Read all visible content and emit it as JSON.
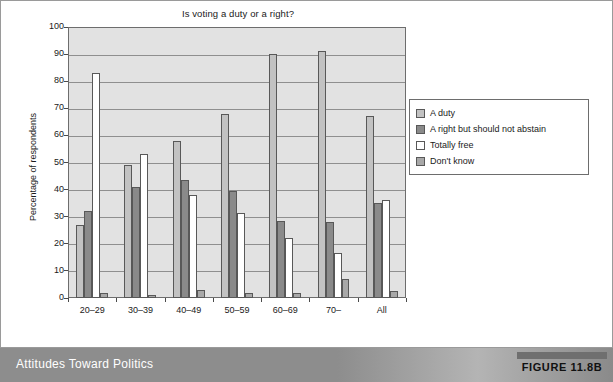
{
  "figure": {
    "caption": "Attitudes Toward Politics",
    "number_label": "FIGURE 11.8B"
  },
  "chart_data": {
    "type": "bar",
    "title": "Is voting a duty or a right?",
    "xlabel": "Age group",
    "ylabel": "Percentage of respondents",
    "ylim": [
      0,
      100
    ],
    "ytick_step": 10,
    "yticks": [
      0,
      10,
      20,
      30,
      40,
      50,
      60,
      70,
      80,
      90,
      100
    ],
    "grid": true,
    "grid_axis": "y",
    "legend_position": "right",
    "categories": [
      "20–29",
      "30–39",
      "40–49",
      "50–59",
      "60–69",
      "70–",
      "All"
    ],
    "series": [
      {
        "name": "A duty",
        "color": "#c2c2c2",
        "values": [
          27,
          49,
          58,
          68,
          90,
          91,
          67
        ]
      },
      {
        "name": "A right but should not abstain",
        "color": "#8a8a8a",
        "values": [
          32,
          41,
          43.5,
          39.5,
          28.5,
          28,
          35
        ]
      },
      {
        "name": "Totally free",
        "color": "#ffffff",
        "values": [
          83,
          53,
          38,
          31.5,
          22,
          16.5,
          36
        ]
      },
      {
        "name": "Don't know",
        "color": "#a8a8a8",
        "values": [
          2,
          1,
          3,
          2,
          2,
          7,
          2.5
        ]
      }
    ]
  },
  "colors": {
    "plot_background": "#e2e2e2",
    "gridline": "#8f8f8f",
    "axis": "#6d6d6d",
    "bar_outline": "#585858",
    "footer_band": "#8d8d8d",
    "footer_text": "#ffffff",
    "figure_tab_bar": "#6f6f6f"
  }
}
